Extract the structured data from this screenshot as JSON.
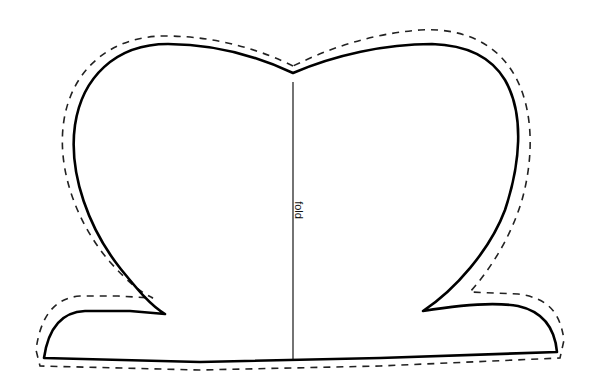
{
  "diagram": {
    "type": "sewing-pattern-piece",
    "labels": {
      "fold": "fold"
    },
    "lines": {
      "cut_line": {
        "style": "solid",
        "color": "#000000"
      },
      "seam_allowance": {
        "style": "dashed",
        "color": "#222222"
      },
      "fold_line": {
        "style": "solid-thin",
        "color": "#000000"
      }
    }
  }
}
